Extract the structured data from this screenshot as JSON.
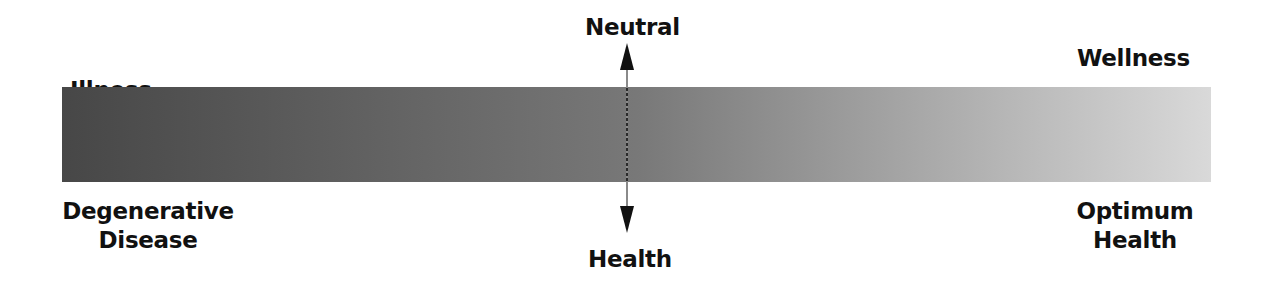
{
  "diagram": {
    "left": {
      "top_label": "Illness",
      "bottom_label_line1": "Degenerative",
      "bottom_label_line2": "Disease"
    },
    "center": {
      "top_label": "Neutral",
      "bottom_label": "Health"
    },
    "right": {
      "top_label": "Wellness",
      "bottom_label_line1": "Optimum",
      "bottom_label_line2": "Health"
    },
    "gradient": {
      "start_color": "#4a4a4a",
      "mid_color": "#7a7a7a",
      "end_color": "#d8d8d8"
    },
    "arrow_color": "#111111"
  }
}
